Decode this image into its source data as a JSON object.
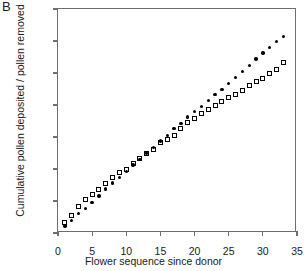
{
  "panel": {
    "label": "B"
  },
  "axes": {
    "xlabel": "Flower sequence since donor",
    "ylabel": "Cumulative pollen deposited / pollen removed",
    "xticks": [
      "0",
      "5",
      "10",
      "15",
      "20",
      "25",
      "30",
      "35"
    ],
    "yticks": [
      "0",
      "0.005",
      "0.01",
      "0.015",
      "0.02",
      "0.025",
      "0.03",
      "0.035"
    ]
  },
  "chart_data": {
    "type": "scatter",
    "title": "B",
    "xlabel": "Flower sequence since donor",
    "ylabel": "Cumulative pollen deposited / pollen removed",
    "xlim": [
      0,
      35
    ],
    "ylim": [
      0,
      0.035
    ],
    "xticks": [
      0,
      5,
      10,
      15,
      20,
      25,
      30,
      35
    ],
    "yticks": [
      0,
      0.005,
      0.01,
      0.015,
      0.02,
      0.025,
      0.03,
      0.035
    ],
    "grid": false,
    "legend": null,
    "series": [
      {
        "name": "open-squares",
        "marker": "open-square",
        "color": "#000000",
        "x": [
          1,
          2,
          3,
          4,
          5,
          6,
          7,
          8,
          9,
          10,
          11,
          12,
          13,
          14,
          15,
          16,
          17,
          18,
          19,
          20,
          21,
          22,
          23,
          24,
          25,
          26,
          27,
          28,
          29,
          30,
          31,
          32,
          33
        ],
        "y": [
          0.0016,
          0.0027,
          0.0042,
          0.0052,
          0.006,
          0.0068,
          0.0078,
          0.0087,
          0.0094,
          0.01,
          0.0108,
          0.0116,
          0.0124,
          0.013,
          0.0141,
          0.0146,
          0.0153,
          0.0163,
          0.0172,
          0.0179,
          0.0187,
          0.0193,
          0.0199,
          0.0205,
          0.0211,
          0.0217,
          0.0223,
          0.023,
          0.0236,
          0.0242,
          0.025,
          0.0256,
          0.0266
        ]
      },
      {
        "name": "filled-circles",
        "marker": "filled-circle",
        "color": "#000000",
        "x": [
          1,
          2,
          3,
          4,
          5,
          6,
          7,
          8,
          9,
          10,
          11,
          12,
          13,
          14,
          15,
          16,
          17,
          18,
          19,
          20,
          21,
          22,
          23,
          24,
          25,
          26,
          27,
          28,
          29,
          30,
          31,
          32,
          33
        ],
        "y": [
          0.0011,
          0.002,
          0.003,
          0.0038,
          0.0048,
          0.0058,
          0.0069,
          0.0078,
          0.0087,
          0.0096,
          0.0106,
          0.0115,
          0.0125,
          0.0134,
          0.0144,
          0.0152,
          0.0163,
          0.0171,
          0.0181,
          0.019,
          0.0198,
          0.0207,
          0.0216,
          0.0224,
          0.0234,
          0.0243,
          0.0252,
          0.0262,
          0.0272,
          0.0281,
          0.029,
          0.0299,
          0.0307
        ]
      }
    ]
  }
}
